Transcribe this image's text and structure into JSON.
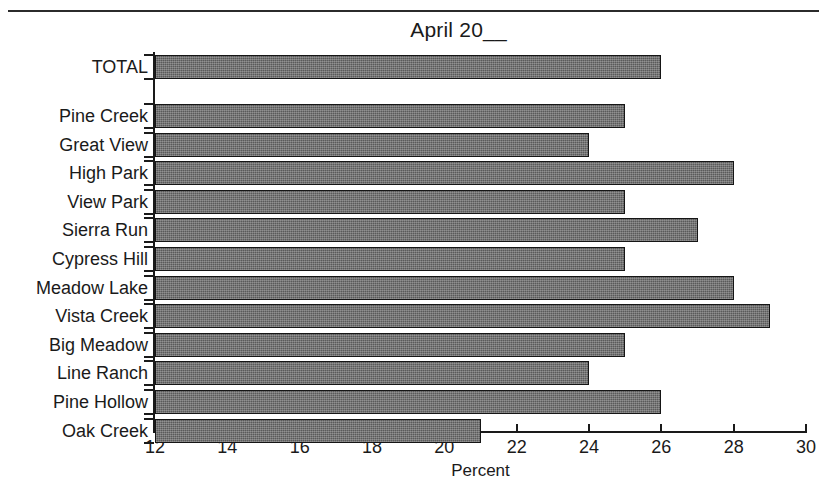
{
  "chart_data": {
    "type": "bar",
    "orientation": "horizontal",
    "title": "April 20__",
    "xlabel": "Percent",
    "ylabel": "",
    "xlim": [
      12,
      30
    ],
    "xticks": [
      12,
      14,
      16,
      18,
      20,
      22,
      24,
      26,
      28,
      30
    ],
    "grid": false,
    "legend": null,
    "categories": [
      "TOTAL",
      "Pine Creek",
      "Great View",
      "High Park",
      "View Park",
      "Sierra Run",
      "Cypress Hill",
      "Meadow Lake",
      "Vista Creek",
      "Big Meadow",
      "Line Ranch",
      "Pine Hollow",
      "Oak Creek"
    ],
    "values": [
      26,
      25,
      24,
      28,
      25,
      27,
      25,
      28,
      29,
      25,
      24,
      26,
      21
    ],
    "series": [
      {
        "name": "Percent",
        "values": [
          26,
          25,
          24,
          28,
          25,
          27,
          25,
          28,
          29,
          25,
          24,
          26,
          21
        ]
      }
    ]
  },
  "style": {
    "bar_fill": "#5a5a5a",
    "bar_border": "#151515",
    "axis_color": "#1a1a1a",
    "background": "#ffffff"
  }
}
